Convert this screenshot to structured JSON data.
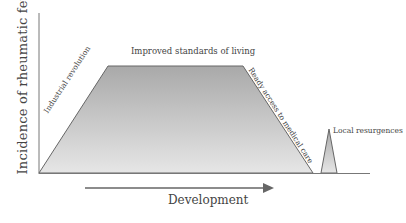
{
  "diagram": {
    "y_axis_label": "Incidence of rheumatic fever",
    "x_axis_label": "Development",
    "phases": {
      "rise": "Industrial revolution",
      "plateau": "Improved standards of living",
      "decline": "Ready access to medical care",
      "resurgence": "Local resurgences"
    },
    "colors": {
      "axis": "#6b6b6b",
      "fill_top": "#a9a9a9",
      "fill_bottom": "#e6e6e6",
      "arrow": "#666666"
    }
  }
}
